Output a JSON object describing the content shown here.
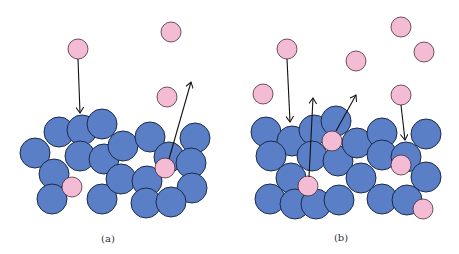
{
  "colors": {
    "atom": "#5b7fc7",
    "atom_stroke": "#1a2a4a",
    "ion": "#f4bcd4",
    "ion_stroke": "#4a2a3a",
    "arrow": "#111111"
  },
  "atom_radius": 15,
  "ion_radius": 10,
  "panels": [
    {
      "label": "(a)",
      "label_pos": [
        108,
        242
      ],
      "atoms": [
        [
          59,
          132
        ],
        [
          82,
          130
        ],
        [
          102,
          124
        ],
        [
          35,
          153
        ],
        [
          80,
          156
        ],
        [
          104,
          159
        ],
        [
          123,
          146
        ],
        [
          150,
          137
        ],
        [
          195,
          138
        ],
        [
          54,
          174
        ],
        [
          52,
          199
        ],
        [
          102,
          199
        ],
        [
          121,
          179
        ],
        [
          147,
          181
        ],
        [
          169,
          157
        ],
        [
          191,
          163
        ],
        [
          192,
          188
        ],
        [
          146,
          203
        ],
        [
          171,
          202
        ]
      ],
      "ions": [
        [
          78,
          49
        ],
        [
          171,
          32
        ],
        [
          167,
          97
        ],
        [
          72,
          187
        ],
        [
          165,
          168
        ]
      ],
      "arrows": [
        [
          78,
          59,
          80,
          113
        ],
        [
          169,
          159,
          191,
          82
        ]
      ]
    },
    {
      "label": "(b)",
      "label_pos": [
        341,
        241
      ],
      "atoms": [
        [
          266,
          132
        ],
        [
          292,
          141
        ],
        [
          314,
          130
        ],
        [
          336,
          121
        ],
        [
          271,
          156
        ],
        [
          312,
          156
        ],
        [
          338,
          161
        ],
        [
          357,
          143
        ],
        [
          382,
          133
        ],
        [
          426,
          134
        ],
        [
          382,
          155
        ],
        [
          406,
          157
        ],
        [
          291,
          178
        ],
        [
          361,
          178
        ],
        [
          426,
          177
        ],
        [
          270,
          199
        ],
        [
          295,
          204
        ],
        [
          316,
          204
        ],
        [
          339,
          200
        ],
        [
          382,
          199
        ],
        [
          407,
          200
        ]
      ],
      "ions": [
        [
          287,
          49
        ],
        [
          263,
          94
        ],
        [
          356,
          61
        ],
        [
          401,
          27
        ],
        [
          424,
          52
        ],
        [
          401,
          95
        ],
        [
          332,
          141
        ],
        [
          308,
          186
        ],
        [
          401,
          165
        ],
        [
          423,
          209
        ]
      ],
      "arrows": [
        [
          287,
          59,
          290,
          122
        ],
        [
          309,
          177,
          313,
          98
        ],
        [
          336,
          131,
          356,
          95
        ],
        [
          401,
          105,
          405,
          140
        ]
      ]
    }
  ]
}
